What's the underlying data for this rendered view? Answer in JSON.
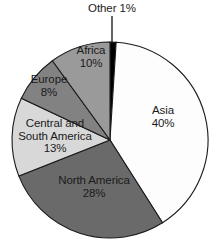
{
  "chart_data": {
    "type": "pie",
    "title": "",
    "subtitle": "",
    "xlabel": "",
    "ylabel": "",
    "legend_position": "none",
    "labels_position": "inside-slice-with-leader-for-small",
    "grid": false,
    "units": "percent",
    "total": 100,
    "categories": [
      "Other",
      "Asia",
      "North America",
      "Central and South America",
      "Europe",
      "Africa"
    ],
    "values": [
      1,
      40,
      28,
      13,
      8,
      10
    ],
    "slices": [
      {
        "name": "Other",
        "value": 1,
        "value_label": "1%",
        "label_line1": "Other 1%",
        "label_line2": "",
        "color": "#000000",
        "start_angle_deg": 0,
        "end_angle_deg": 3.6,
        "has_leader_line": true
      },
      {
        "name": "Asia",
        "value": 40,
        "value_label": "40%",
        "label_line1": "Asia",
        "label_line2": "40%",
        "color": "#fdfdfd",
        "start_angle_deg": 3.6,
        "end_angle_deg": 147.6,
        "has_leader_line": false
      },
      {
        "name": "North America",
        "value": 28,
        "value_label": "28%",
        "label_line1": "North America",
        "label_line2": "28%",
        "color": "#6a6a6a",
        "start_angle_deg": 147.6,
        "end_angle_deg": 248.4,
        "has_leader_line": false
      },
      {
        "name": "Central and South America",
        "value": 13,
        "value_label": "13%",
        "label_line1": "Central and",
        "label_line2": "South America",
        "color": "#d8d8d8",
        "start_angle_deg": 248.4,
        "end_angle_deg": 295.2,
        "has_leader_line": false
      },
      {
        "name": "Europe",
        "value": 8,
        "value_label": "8%",
        "label_line1": "Europe",
        "label_line2": "8%",
        "color": "#828282",
        "start_angle_deg": 295.2,
        "end_angle_deg": 324.0,
        "has_leader_line": false
      },
      {
        "name": "Africa",
        "value": 10,
        "value_label": "10%",
        "label_line1": "Africa",
        "label_line2": "10%",
        "color": "#9a9a9a",
        "start_angle_deg": 324.0,
        "end_angle_deg": 360.0,
        "has_leader_line": false
      }
    ],
    "geometry": {
      "center_x": 110,
      "center_y": 140,
      "radius": 98,
      "start_at_deg": 0,
      "direction": "clockwise"
    },
    "style": {
      "background": "#ffffff",
      "outline_color": "#1a1a1a",
      "text_color": "#1b1b1b"
    }
  },
  "labels": {
    "other": {
      "line1": "Other 1%",
      "line2": ""
    },
    "asia": {
      "line1": "Asia",
      "line2": "40%"
    },
    "north": {
      "line1": "North America",
      "line2": "28%"
    },
    "central": {
      "line1": "Central and",
      "line2": "South America",
      "line3": "13%"
    },
    "europe": {
      "line1": "Europe",
      "line2": "8%"
    },
    "africa": {
      "line1": "Africa",
      "line2": "10%"
    }
  }
}
